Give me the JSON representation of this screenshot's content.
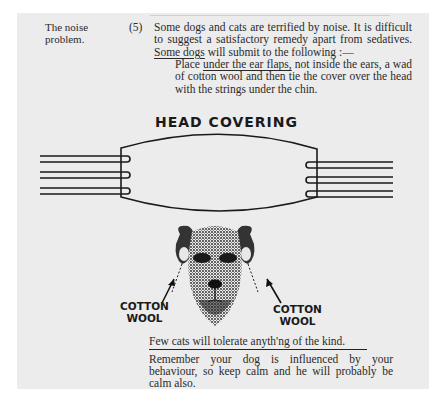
{
  "margin_note": {
    "line1": "The noise",
    "line2": "problem."
  },
  "item_number": "(5)",
  "paragraph": {
    "text_before": "Some dogs and cats are terrified by noise.    It is difficult to suggest a satisfactory remedy apart from sedatives. ",
    "underlined": "Some dogs",
    "text_after": " will submit to the following :—"
  },
  "instruction": {
    "text_before": "Place ",
    "underlined": "under the ear flaps,",
    "text_after": " not inside the ears, a wad of cotton wool and then tie the cover over the head with the strings under the chin."
  },
  "diagram": {
    "title": "HEAD COVERING",
    "left_label": {
      "line1": "COTTON",
      "line2": "WOOL"
    },
    "right_label": {
      "line1": "COTTON",
      "line2": "WOOL"
    }
  },
  "cats_note": "Few cats will tolerate anyth'ng of the kind.",
  "closing": "Remember your dog is influenced by your behaviour, so keep calm and he will probably be calm also."
}
